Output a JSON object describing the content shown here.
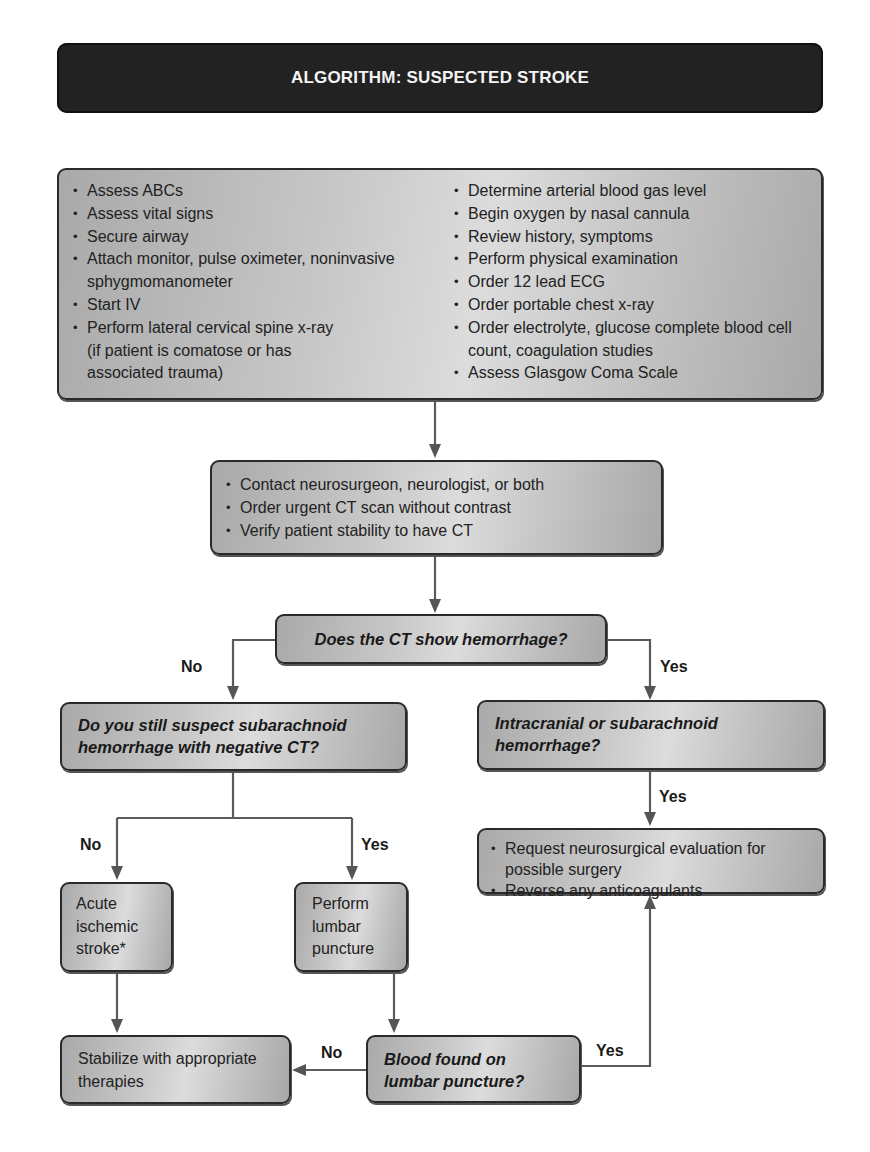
{
  "title": "ALGORITHM: SUSPECTED STROKE",
  "initial_actions": {
    "left": [
      "Assess ABCs",
      "Assess vital signs",
      "Secure airway",
      "Attach monitor, pulse oximeter, noninvasive sphygmomanometer",
      "Start  IV",
      "Perform lateral cervical spine x-ray (if patient is comatose or has associated trauma)"
    ],
    "right": [
      "Determine arterial blood gas level",
      "Begin oxygen by nasal cannula",
      "Review history, symptoms",
      "Perform physical examination",
      "Order 12 lead ECG",
      "Order portable chest x-ray",
      "Order electrolyte, glucose complete blood cell count, coagulation studies",
      "Assess Glasgow Coma Scale"
    ]
  },
  "second_actions": [
    "Contact neurosurgeon, neurologist, or both",
    "Order urgent CT scan without contrast",
    "Verify patient stability to have CT"
  ],
  "decisions": {
    "ct_hemorrhage": "Does the CT show hemorrhage?",
    "suspect_sah": "Do you still suspect subarachnoid hemorrhage with negative CT?",
    "intracranial": "Intracranial or subarachnoid hemorrhage?",
    "blood_lp": "Blood found on lumbar puncture?"
  },
  "outcomes": {
    "acute_ischemic": "Acute ischemic stroke*",
    "perform_lp": "Perform lumbar puncture",
    "stabilize": "Stabilize with appropriate therapies",
    "neurosurgical": [
      "Request neurosurgical evaluation for possible surgery",
      "Reverse any anticoagulants"
    ]
  },
  "edge_labels": {
    "ct_no": "No",
    "ct_yes": "Yes",
    "sah_no": "No",
    "sah_yes": "Yes",
    "intracranial_yes": "Yes",
    "lp_no": "No",
    "lp_yes": "Yes"
  },
  "colors": {
    "title_bg": "#222222",
    "title_text": "#f4f4f4",
    "box_fill": "#c4c4c4",
    "box_border": "#2a2a2a",
    "connector": "#555555"
  }
}
